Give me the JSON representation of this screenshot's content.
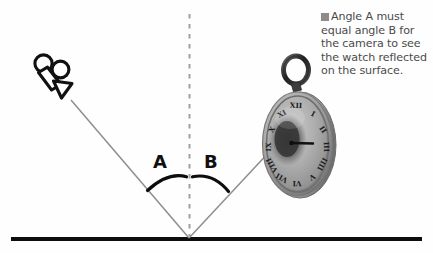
{
  "figure": {
    "background_color": "#fefefe"
  },
  "caption": {
    "bullet_icon": "gray-square-bullet",
    "bullet_color": "#8c8c8c",
    "text_color": "#4a4a4a",
    "text": "Angle A must equal angle B for the camera to see the watch reflected on the surface.",
    "lines": [
      "Angle A must",
      "equal angle B for",
      "the camera to",
      "see the watch",
      "reflected on the",
      "surface."
    ]
  },
  "labels": {
    "angle_a": "A",
    "angle_b": "B",
    "label_color": "#101010"
  },
  "objects": {
    "camera": {
      "icon": "movie-camera-icon",
      "stroke_color": "#111111",
      "fill_color": "#ffffff",
      "position": {
        "x": 55,
        "y": 78
      }
    },
    "watch": {
      "icon": "pocket-watch-icon",
      "description": "pocket watch with roman numerals and bail ring",
      "rim_color": "#9a9a9a",
      "face_color": "#b5b5b5",
      "shadow_color": "#3a3a3a",
      "position": {
        "x": 297,
        "y": 140
      }
    }
  },
  "geometry": {
    "surface_line": {
      "name": "reflective-surface",
      "color": "#0d0d0d",
      "x1": 11,
      "y1": 239,
      "x2": 422,
      "y2": 239,
      "thickness": 4
    },
    "normal_line": {
      "name": "normal-dashed-line",
      "color": "#9e9e9e",
      "x1": 189,
      "y1": 14,
      "x2": 189,
      "y2": 237,
      "dash": "4 5"
    },
    "incident_ray": {
      "name": "incident-ray",
      "color": "#8e8e8e",
      "x1": 70,
      "y1": 99,
      "x2": 189,
      "y2": 238
    },
    "reflected_ray": {
      "name": "reflected-ray",
      "color": "#8e8e8e",
      "x1": 189,
      "y1": 238,
      "x2": 264,
      "y2": 158
    },
    "arc_a": {
      "name": "angle-arc-a",
      "color": "#0d0d0d",
      "start": {
        "x": 148,
        "y": 190
      },
      "end": {
        "x": 186,
        "y": 177
      }
    },
    "arc_b": {
      "name": "angle-arc-b",
      "color": "#0d0d0d",
      "start": {
        "x": 193,
        "y": 177
      },
      "end": {
        "x": 228,
        "y": 191
      }
    },
    "vertex": {
      "x": 189,
      "y": 238
    }
  },
  "watch_face": {
    "numerals": [
      "XII",
      "I",
      "II",
      "III",
      "IIII",
      "V",
      "VI",
      "VII",
      "VIII",
      "IX",
      "X",
      "XI"
    ],
    "hand_direction": "3-oclock"
  }
}
